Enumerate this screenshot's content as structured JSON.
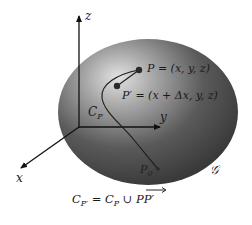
{
  "diagram": {
    "region_label": "𝒢",
    "axes": {
      "x_label": "x",
      "y_label": "y",
      "z_label": "z"
    },
    "curve_label": "C",
    "curve_label_sub": "P",
    "points": {
      "P": {
        "label": "P = (x, y, z)"
      },
      "P_prime": {
        "label": "P′ = (x + Δx, y, z)"
      },
      "P0": {
        "label": "P",
        "sub": "0"
      }
    },
    "formula": {
      "lhs": "C",
      "lhs_sub": "P′",
      "middle": " = C",
      "middle_sub": "P",
      "union": " ∪ ",
      "rhs": "PP′",
      "rhs_arrow": "→"
    },
    "colors": {
      "region_dark": "#3c3c3c",
      "region_light": "#d8d8d8",
      "ink": "#1a1a1a"
    }
  }
}
